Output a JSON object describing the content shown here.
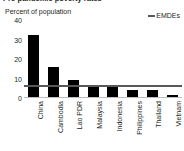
{
  "figure": {
    "title_partial": "Pre-pandemic poverty rates",
    "subtitle": "Percent of population"
  },
  "legend": {
    "marker_name": "line-marker",
    "label": "EMDEs",
    "color": "#58595b"
  },
  "colors": {
    "bar": "#000000",
    "reference_line": "#58595b",
    "axis": "#bcbec0",
    "text": "#231f20",
    "background": "#ffffff"
  },
  "chart_data": {
    "type": "bar",
    "title": "Pre-pandemic poverty rates",
    "xlabel": "",
    "ylabel": "Percent of population",
    "ylim": [
      0,
      40
    ],
    "yticks": [
      0,
      10,
      20,
      30,
      40
    ],
    "ytick_labels": [
      "0",
      "10",
      "20",
      "30",
      "40"
    ],
    "grid": false,
    "legend_position": "top-right",
    "categories": [
      "China",
      "Cambodia",
      "Lao PDR",
      "Malaysia",
      "Indonesia",
      "Philippines",
      "Thailand",
      "Vietnam"
    ],
    "series": [
      {
        "name": "Percent of population",
        "type": "bar",
        "values": [
          32,
          15.5,
          8.5,
          6,
          5.8,
          3.5,
          3.5,
          1
        ]
      },
      {
        "name": "EMDEs",
        "type": "hline",
        "value": 5.8
      }
    ]
  }
}
